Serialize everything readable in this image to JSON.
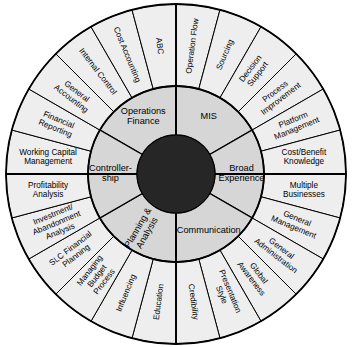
{
  "diagram": {
    "type": "concentric-radial-wheel",
    "center": {
      "x": 176,
      "y": 174
    },
    "radii": {
      "hub": 39,
      "inner_ring_outer": 88,
      "outer_ring_outer": 170
    },
    "colors": {
      "hub": "#262626",
      "inner_ring": "#d6d6d6",
      "outer_ring": "#eeeeee",
      "stroke": "#000000",
      "background": "#ffffff"
    },
    "hub": {
      "label": "",
      "filled": true
    },
    "inner_ring": {
      "count": 6,
      "segments": [
        {
          "id": "operations-finance",
          "label": "Operations\nFinance",
          "start_deg": -60,
          "end_deg": 0,
          "orientation": "horizontal"
        },
        {
          "id": "mis",
          "label": "MIS",
          "start_deg": 0,
          "end_deg": 60,
          "orientation": "horizontal"
        },
        {
          "id": "broad-experience",
          "label": "Broad\nExperience",
          "start_deg": 60,
          "end_deg": 120,
          "orientation": "radial"
        },
        {
          "id": "communication",
          "label": "Communication",
          "start_deg": 120,
          "end_deg": 180,
          "orientation": "horizontal"
        },
        {
          "id": "planning-analysis",
          "label": "Planning &\nAnalysis",
          "start_deg": 180,
          "end_deg": 240,
          "orientation": "radial"
        },
        {
          "id": "controllership",
          "label": "Controller-\nship",
          "start_deg": 240,
          "end_deg": 300,
          "orientation": "radial"
        }
      ]
    },
    "outer_ring": {
      "count": 20,
      "segment_span_deg": 18,
      "segments": [
        {
          "id": "operation-flow",
          "label": "Operation Flow",
          "index": 0
        },
        {
          "id": "sourcing",
          "label": "Sourcing",
          "index": 1
        },
        {
          "id": "decision-support",
          "label": "Decision\nSupport",
          "index": 2
        },
        {
          "id": "process-improvement",
          "label": "Process\nImprovement",
          "index": 3
        },
        {
          "id": "platform-management",
          "label": "Platform\nManagement",
          "index": 4
        },
        {
          "id": "cost-benefit-knowledge",
          "label": "Cost/Benefit\nKnowledge",
          "index": 5
        },
        {
          "id": "multiple-businesses",
          "label": "Multiple\nBusinesses",
          "index": 6
        },
        {
          "id": "general-management",
          "label": "General\nManagement",
          "index": 7
        },
        {
          "id": "general-administration",
          "label": "General\nAdministration",
          "index": 8
        },
        {
          "id": "global-awareness",
          "label": "Global\nAwareness",
          "index": 9
        },
        {
          "id": "presentation-style",
          "label": "Presentation\nStyle",
          "index": 10
        },
        {
          "id": "credibility",
          "label": "Credibility",
          "index": 11
        },
        {
          "id": "education",
          "label": "Education",
          "index": 12
        },
        {
          "id": "influencing",
          "label": "Influencing",
          "index": 13
        },
        {
          "id": "managing-budget-process",
          "label": "Managing\nBudget\nProcess",
          "index": 14
        },
        {
          "id": "slc-financial-planning",
          "label": "SLC Financial\nPlanning",
          "index": 15
        },
        {
          "id": "investment-abandonment-analysis",
          "label": "Investment/\nAbandonment\nAnalysis",
          "index": 16
        },
        {
          "id": "profitability-analysis",
          "label": "Profitability\nAnalysis",
          "index": 17
        },
        {
          "id": "working-capital-management",
          "label": "Working Capital\nManagement",
          "index": 18
        },
        {
          "id": "financial-reporting",
          "label": "Financial\nReporting",
          "index": 19
        },
        {
          "id": "general-accounting",
          "label": "General\nAccounting",
          "index": 20
        },
        {
          "id": "internal-control",
          "label": "Internal Control",
          "index": 21
        },
        {
          "id": "cost-accounting",
          "label": "Cost Accounting",
          "index": 22
        },
        {
          "id": "abc",
          "label": "ABC",
          "index": 23
        }
      ]
    }
  }
}
